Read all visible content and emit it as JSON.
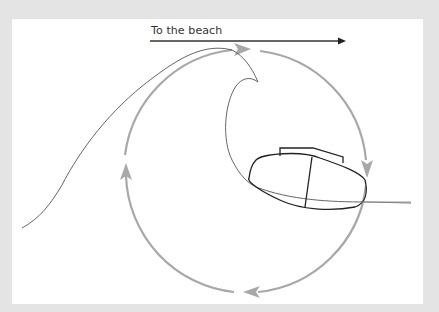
{
  "diagram": {
    "direction_label": "To the beach",
    "colors": {
      "frame": "#e4e4e4",
      "panel": "#ffffff",
      "circulation": "#a8a8a8",
      "wave_line": "#555555",
      "boat_outline": "#222222",
      "beach_arrow": "#333333",
      "waterline": "#999999"
    },
    "elements": [
      {
        "name": "beach-direction-arrow",
        "label": "To the beach"
      },
      {
        "name": "wave-profile"
      },
      {
        "name": "circular-orbit-arrows",
        "arrow_count": 4,
        "direction": "clockwise"
      },
      {
        "name": "boat-hull"
      },
      {
        "name": "waterline"
      }
    ]
  }
}
